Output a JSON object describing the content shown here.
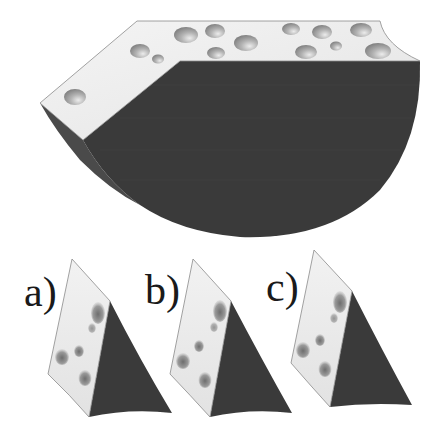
{
  "figure": {
    "colors": {
      "background": "#ffffff",
      "cheese_face": "#ededed",
      "cheese_face_light": "#f6f6f6",
      "cheese_edge": "#8a8a8a",
      "rind_dark": "#3b3b3b",
      "rind_side": "#555555",
      "hole_dark": "#8c8c8c",
      "hole_light": "#e8e8e8"
    },
    "main_piece": {
      "description": "large semicircular cheese block with holes on top face"
    },
    "panels": [
      {
        "id": "a",
        "label": "a)"
      },
      {
        "id": "b",
        "label": "b)"
      },
      {
        "id": "c",
        "label": "c)"
      }
    ]
  }
}
